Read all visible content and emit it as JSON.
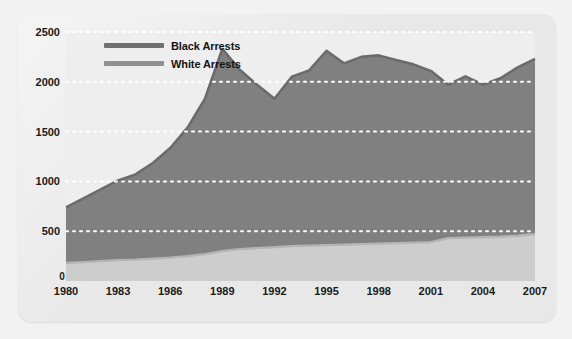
{
  "chart_data": {
    "type": "area",
    "title": "",
    "subtitle": "",
    "xlabel": "",
    "ylabel": "",
    "stacked": true,
    "grid": true,
    "grid_style": "dotted-white-horizontal",
    "legend_position": "top-left-inside",
    "xlim": [
      1980,
      2007
    ],
    "ylim": [
      0,
      2500
    ],
    "yticks": [
      0,
      500,
      1000,
      1500,
      2000,
      2500
    ],
    "ytick_labels": [
      "0",
      "500",
      "1000",
      "1500",
      "2000",
      "2500"
    ],
    "xticks": [
      1980,
      1983,
      1986,
      1989,
      1992,
      1995,
      1998,
      2001,
      2004,
      2007
    ],
    "xtick_labels": [
      "1980",
      "1983",
      "1986",
      "1989",
      "1992",
      "1995",
      "1998",
      "2001",
      "2004",
      "2007"
    ],
    "x": [
      1980,
      1981,
      1982,
      1983,
      1984,
      1985,
      1986,
      1987,
      1988,
      1989,
      1990,
      1991,
      1992,
      1993,
      1994,
      1995,
      1996,
      1997,
      1998,
      1999,
      2000,
      2001,
      2002,
      2003,
      2004,
      2005,
      2006,
      2007
    ],
    "series": [
      {
        "name": "Black Arrests",
        "color": "#808080",
        "line_color": "#6b6b6b",
        "values": [
          560,
          640,
          720,
          800,
          855,
          960,
          1100,
          1290,
          1560,
          2030,
          1800,
          1640,
          1490,
          1700,
          1760,
          1950,
          1820,
          1880,
          1890,
          1840,
          1790,
          1720,
          1540,
          1620,
          1530,
          1590,
          1690,
          1760
        ]
      },
      {
        "name": "White Arrests",
        "color": "#cdcdcd",
        "line_color": "#b4b4b4",
        "values": [
          180,
          190,
          200,
          210,
          215,
          225,
          235,
          250,
          270,
          300,
          320,
          330,
          340,
          350,
          355,
          360,
          365,
          370,
          375,
          380,
          385,
          390,
          430,
          435,
          440,
          445,
          455,
          470
        ]
      }
    ]
  },
  "legend": {
    "items": [
      {
        "label": "Black Arrests",
        "color": "#707070"
      },
      {
        "label": "White Arrests",
        "color": "#909090"
      }
    ]
  },
  "axes": {
    "zero_label": "0"
  },
  "colors": {
    "page_background": "#f2f2f2",
    "panel_background": "#e8e8e8",
    "plot_background": "#eeeeee",
    "gridline": "#ffffff",
    "text": "#1a1a1a",
    "black_series_fill": "#808080",
    "white_series_fill": "#cdcdcd"
  }
}
